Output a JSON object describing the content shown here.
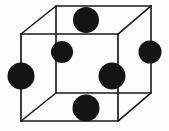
{
  "figure": {
    "type": "crystal-lattice-diagram",
    "background_color": "#fdfdfd",
    "canvas": {
      "width": 169,
      "height": 131
    }
  },
  "cube": {
    "label": "cubic unit cell wireframe",
    "edge_color": "#1a1a1a",
    "edge_width": 1.6,
    "front_face": {
      "label": "front square face",
      "top_left": [
        21,
        34
      ],
      "top_right": [
        118,
        34
      ],
      "bottom_right": [
        118,
        121
      ],
      "bottom_left": [
        21,
        121
      ]
    },
    "back_face": {
      "label": "back square face",
      "top_left": [
        56,
        6
      ],
      "top_right": [
        151,
        6
      ],
      "bottom_right": [
        151,
        93
      ],
      "bottom_left": [
        56,
        93
      ]
    },
    "connectors": [
      {
        "name": "top-left-depth-edge",
        "from": [
          21,
          34
        ],
        "to": [
          56,
          6
        ]
      },
      {
        "name": "top-right-depth-edge",
        "from": [
          118,
          34
        ],
        "to": [
          151,
          6
        ]
      },
      {
        "name": "bottom-right-depth-edge",
        "from": [
          118,
          121
        ],
        "to": [
          151,
          93
        ]
      },
      {
        "name": "bottom-left-depth-edge",
        "from": [
          21,
          121
        ],
        "to": [
          56,
          93
        ]
      }
    ]
  },
  "atoms": {
    "color": "#141414",
    "count": 7,
    "items": [
      {
        "name": "atom-top-face-center",
        "cx": 86,
        "cy": 20,
        "r": 13
      },
      {
        "name": "atom-back-face-center",
        "cx": 62,
        "cy": 52,
        "r": 11
      },
      {
        "name": "atom-right-face-center",
        "cx": 150,
        "cy": 52,
        "r": 11.5
      },
      {
        "name": "atom-left-face-center",
        "cx": 21,
        "cy": 76,
        "r": 13.5
      },
      {
        "name": "atom-front-face-center",
        "cx": 112,
        "cy": 76,
        "r": 13.5
      },
      {
        "name": "atom-bottom-face-center",
        "cx": 86,
        "cy": 108,
        "r": 13.5
      }
    ]
  }
}
